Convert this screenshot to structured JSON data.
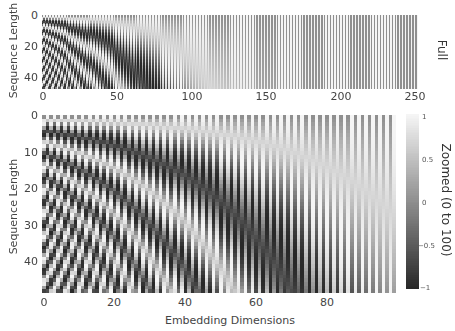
{
  "chart_data": {
    "type": "heatmap",
    "colormap": "gray",
    "color_range": [
      -1,
      1
    ],
    "panels": [
      {
        "id": "full",
        "facet_label": "Full",
        "ylabel": "Sequence Length",
        "xlabel": "",
        "x_range": [
          0,
          252
        ],
        "y_range": [
          0,
          49
        ],
        "d_model": 256,
        "n_positions": 49,
        "n_dims_shown": 256,
        "x_ticks": [
          "0",
          "50",
          "100",
          "150",
          "200",
          "250"
        ],
        "x_tick_values": [
          0,
          50,
          100,
          150,
          200,
          250
        ],
        "y_ticks": [
          "0",
          "20",
          "40"
        ],
        "y_tick_values": [
          0,
          20,
          40
        ]
      },
      {
        "id": "zoomed",
        "facet_label": "Zoomed (0 to 100)",
        "ylabel": "Sequence Length",
        "xlabel": "Embedding Dimensions",
        "x_range": [
          0,
          100
        ],
        "y_range": [
          0,
          49
        ],
        "d_model": 256,
        "n_positions": 49,
        "n_dims_shown": 100,
        "x_ticks": [
          "0",
          "20",
          "40",
          "60",
          "80"
        ],
        "x_tick_values": [
          0,
          20,
          40,
          60,
          80
        ],
        "y_ticks": [
          "0",
          "10",
          "20",
          "30",
          "40"
        ],
        "y_tick_values": [
          0,
          10,
          20,
          30,
          40
        ]
      }
    ],
    "colorbar": {
      "ticks": [
        "1",
        "0.5",
        "0",
        "−0.5",
        "−1"
      ],
      "tick_values": [
        1,
        0.5,
        0,
        -0.5,
        -1
      ]
    }
  }
}
